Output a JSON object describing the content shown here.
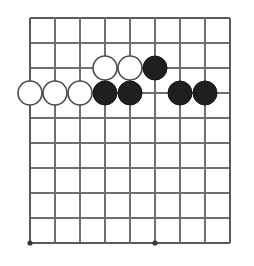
{
  "diagram": {
    "kind": "go-board-diagram",
    "board": {
      "columns": 9,
      "rows": 10,
      "column_labels": [
        "1",
        "2",
        "3",
        "4",
        "5",
        "6",
        "7",
        "8",
        "9"
      ],
      "row_labels": [
        "1",
        "2",
        "3",
        "4",
        "5",
        "6",
        "7",
        "8",
        "9",
        "10"
      ],
      "origin_x": 30,
      "origin_y": 18,
      "spacing": 25,
      "line_color": "#6f6f6f",
      "edge_color": "#5a5a5a",
      "background_color": "#ffffff"
    },
    "star_points": [
      {
        "col": 1,
        "row": 10
      },
      {
        "col": 6,
        "row": 10
      }
    ],
    "stones": [
      {
        "color": "white",
        "col": 4,
        "row": 3,
        "label": "white-stone-d3"
      },
      {
        "color": "white",
        "col": 5,
        "row": 3,
        "label": "white-stone-e3"
      },
      {
        "color": "black",
        "col": 6,
        "row": 3,
        "label": "black-stone-f3"
      },
      {
        "color": "white",
        "col": 1,
        "row": 4,
        "label": "white-stone-a4"
      },
      {
        "color": "white",
        "col": 2,
        "row": 4,
        "label": "white-stone-b4"
      },
      {
        "color": "white",
        "col": 3,
        "row": 4,
        "label": "white-stone-c4"
      },
      {
        "color": "black",
        "col": 4,
        "row": 4,
        "label": "black-stone-d4"
      },
      {
        "color": "black",
        "col": 5,
        "row": 4,
        "label": "black-stone-e4"
      },
      {
        "color": "black",
        "col": 7,
        "row": 4,
        "label": "black-stone-g4"
      },
      {
        "color": "black",
        "col": 8,
        "row": 4,
        "label": "black-stone-h4"
      }
    ],
    "stone_radius": 12,
    "colors": {
      "black_fill": "#201f1f",
      "black_edge": "#141414",
      "white_fill": "#ffffff",
      "white_edge": "#4a4a4a",
      "star": "#3a3a3a"
    },
    "counts": {
      "black_stones": 5,
      "white_stones": 5,
      "total_stones": 10
    }
  }
}
